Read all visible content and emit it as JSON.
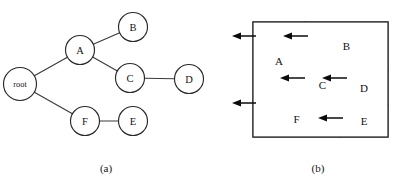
{
  "figure": {
    "background_color": "#ffffff",
    "ink_color": "#1a1a1a",
    "captions": {
      "left": "(a)",
      "right": "(b)"
    }
  },
  "tree": {
    "title": "slicing-tree",
    "nodes": [
      {
        "id": "root",
        "label": "root",
        "cx": 20,
        "cy": 84,
        "r": 16.5
      },
      {
        "id": "A",
        "label": "A",
        "cx": 80,
        "cy": 50,
        "r": 14.5
      },
      {
        "id": "B",
        "label": "B",
        "cx": 133,
        "cy": 27,
        "r": 14.5
      },
      {
        "id": "C",
        "label": "C",
        "cx": 130,
        "cy": 78,
        "r": 14.5
      },
      {
        "id": "D",
        "label": "D",
        "cx": 189,
        "cy": 79,
        "r": 14.5
      },
      {
        "id": "F",
        "label": "F",
        "cx": 85,
        "cy": 121,
        "r": 14.5
      },
      {
        "id": "E",
        "label": "E",
        "cx": 133,
        "cy": 121,
        "r": 14.5
      }
    ],
    "edges": [
      {
        "from": "root",
        "to": "A"
      },
      {
        "from": "root",
        "to": "F"
      },
      {
        "from": "A",
        "to": "B"
      },
      {
        "from": "A",
        "to": "C"
      },
      {
        "from": "C",
        "to": "D"
      },
      {
        "from": "F",
        "to": "E"
      }
    ]
  },
  "floorplan": {
    "title": "slicing-floorplan",
    "outer": {
      "x": 253,
      "y": 22,
      "w": 135,
      "h": 115
    },
    "regions": [
      {
        "id": "A",
        "label": "A",
        "x": 253,
        "y": 22,
        "w": 52,
        "h": 78
      },
      {
        "id": "B",
        "label": "B",
        "x": 305,
        "y": 22,
        "w": 83,
        "h": 48
      },
      {
        "id": "C",
        "label": "C",
        "x": 305,
        "y": 70,
        "w": 35,
        "h": 30
      },
      {
        "id": "D",
        "label": "D",
        "x": 340,
        "y": 70,
        "w": 48,
        "h": 35
      },
      {
        "id": "F",
        "label": "F",
        "x": 253,
        "y": 100,
        "w": 87,
        "h": 37
      },
      {
        "id": "E",
        "label": "E",
        "x": 340,
        "y": 105,
        "w": 48,
        "h": 32
      }
    ],
    "cut_arrows": [
      {
        "id": "cut-outer-top",
        "tip_x": 232,
        "tail_x": 256,
        "y": 36
      },
      {
        "id": "cut-a-b",
        "tip_x": 283,
        "tail_x": 308,
        "y": 36
      },
      {
        "id": "cut-c-left",
        "tip_x": 280,
        "tail_x": 305,
        "y": 78
      },
      {
        "id": "cut-c-d",
        "tip_x": 322,
        "tail_x": 347,
        "y": 78
      },
      {
        "id": "cut-outer-lower",
        "tip_x": 232,
        "tail_x": 256,
        "y": 103
      },
      {
        "id": "cut-f-e",
        "tip_x": 318,
        "tail_x": 343,
        "y": 118
      }
    ]
  },
  "captions": {
    "left": {
      "text": "(a)",
      "x": 106,
      "y": 168
    },
    "right": {
      "text": "(b)",
      "x": 318,
      "y": 168
    }
  }
}
